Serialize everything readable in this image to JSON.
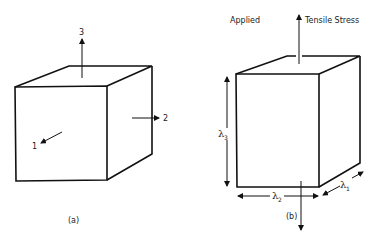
{
  "figure": {
    "panel_a": {
      "caption": "(a)",
      "axes": [
        {
          "label": "1",
          "direction": "out-of-front-face"
        },
        {
          "label": "2",
          "direction": "right"
        },
        {
          "label": "3",
          "direction": "up"
        }
      ]
    },
    "panel_b": {
      "caption": "(b)",
      "stress_label_left": "Applied",
      "stress_label_right": "Tensile Stress",
      "dimensions": [
        {
          "symbol": "λ",
          "subscript": "1",
          "edge": "depth"
        },
        {
          "symbol": "λ",
          "subscript": "2",
          "edge": "width"
        },
        {
          "symbol": "λ",
          "subscript": "3",
          "edge": "height"
        }
      ]
    }
  },
  "colors": {
    "line": "#111111",
    "background": "#ffffff"
  }
}
